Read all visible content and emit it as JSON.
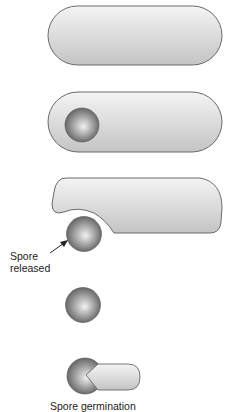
{
  "diagram": {
    "stages": [
      {
        "id": "vegetative-cell",
        "label": ""
      },
      {
        "id": "endospore-in-cell",
        "label": ""
      },
      {
        "id": "spore-released",
        "label": "Spore"
      },
      {
        "id": "free-spore",
        "label": ""
      },
      {
        "id": "spore-germination",
        "label": "Spore germination"
      }
    ],
    "labels": {
      "released_line1": "Spore",
      "released_line2": "released",
      "germination": "Spore germination"
    },
    "colors": {
      "cell_fill_light": "#f2f2f2",
      "cell_fill_dark": "#c8c8c8",
      "cell_stroke": "#6a6a6a",
      "spore_light": "#f0f0f0",
      "spore_dark": "#5a5a5a",
      "text": "#222222"
    }
  }
}
